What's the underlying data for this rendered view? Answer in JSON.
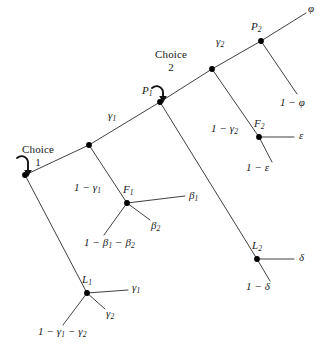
{
  "figure": {
    "type": "decision-tree-diagram",
    "title": "",
    "background_color": "#ffffff",
    "line_color": "#2a2a2a",
    "node_color": "#000000",
    "text_color": "#1a1a1a"
  },
  "annotations": {
    "choice1_word": "Choice",
    "choice1_number": "1",
    "choice2_word": "Choice",
    "choice2_number": "2"
  },
  "nodes": [
    {
      "id": "choice1",
      "label": "",
      "x": 25,
      "y": 175
    },
    {
      "id": "branch1",
      "label": "",
      "x": 89,
      "y": 145
    },
    {
      "id": "P1",
      "label": "P",
      "sub": "1",
      "x": 160,
      "y": 102
    },
    {
      "id": "branch2",
      "label": "",
      "x": 212,
      "y": 69
    },
    {
      "id": "P2",
      "label": "P",
      "sub": "2",
      "x": 261,
      "y": 41
    },
    {
      "id": "F1",
      "label": "F",
      "sub": "1",
      "x": 127,
      "y": 203
    },
    {
      "id": "F2",
      "label": "F",
      "sub": "2",
      "x": 259,
      "y": 137
    },
    {
      "id": "L1",
      "label": "L",
      "sub": "1",
      "x": 87,
      "y": 293
    },
    {
      "id": "L2",
      "label": "L",
      "sub": "2",
      "x": 257,
      "y": 259
    }
  ],
  "branch_labels": [
    {
      "id": "gamma1-spine",
      "text": "γ",
      "sub": "1",
      "x": 113,
      "y": 114
    },
    {
      "id": "gamma2-spine",
      "text": "γ",
      "sub": "2",
      "x": 220,
      "y": 40
    },
    {
      "id": "phi-top",
      "text": "φ",
      "sub": "",
      "x": 308,
      "y": 4
    },
    {
      "id": "one-minus-phi",
      "text": "1 − φ",
      "sub": "",
      "x": 282,
      "y": 100
    },
    {
      "id": "one-minus-gamma1",
      "text": "1 − γ",
      "sub": "1",
      "x": 78,
      "y": 185
    },
    {
      "id": "beta1",
      "text": "β",
      "sub": "1",
      "x": 190,
      "y": 196
    },
    {
      "id": "beta2",
      "text": "β",
      "sub": "2",
      "x": 152,
      "y": 224
    },
    {
      "id": "one-minus-beta1-beta2",
      "text": "1 − β",
      "sub": "1",
      "text2": " − β",
      "sub2": "2",
      "x": 84,
      "y": 240
    },
    {
      "id": "one-minus-gamma2",
      "text": "1 − γ",
      "sub": "2",
      "x": 212,
      "y": 126
    },
    {
      "id": "epsilon",
      "text": "ε",
      "sub": "",
      "x": 299,
      "y": 132
    },
    {
      "id": "one-minus-epsilon",
      "text": "1 − ε",
      "sub": "",
      "x": 248,
      "y": 164
    },
    {
      "id": "delta",
      "text": "δ",
      "sub": "",
      "x": 299,
      "y": 253
    },
    {
      "id": "one-minus-delta",
      "text": "1 − δ",
      "sub": "",
      "x": 248,
      "y": 283
    },
    {
      "id": "gamma1-L1",
      "text": "γ",
      "sub": "1",
      "x": 133,
      "y": 286
    },
    {
      "id": "gamma2-L1",
      "text": "γ",
      "sub": "2",
      "x": 106,
      "y": 312
    },
    {
      "id": "one-minus-gamma1-gamma2",
      "text": "1 − γ",
      "sub": "1",
      "text2": " − γ",
      "sub2": "2",
      "x": 38,
      "y": 329
    }
  ],
  "edges": [
    {
      "id": "choice1-to-branch1",
      "from": "choice1",
      "to": "branch1"
    },
    {
      "id": "branch1-to-P1",
      "from": "branch1",
      "to": "P1"
    },
    {
      "id": "P1-to-branch2",
      "from": "P1",
      "to": "branch2"
    },
    {
      "id": "branch2-to-P2",
      "from": "branch2",
      "to": "P2"
    },
    {
      "id": "P2-to-phi",
      "from": "P2",
      "to": "phi-end"
    },
    {
      "id": "P2-to-oneminusphi",
      "from": "P2",
      "to": "oneminusphi-end"
    },
    {
      "id": "branch1-to-F1",
      "from": "branch1",
      "to": "F1"
    },
    {
      "id": "branch2-to-F2",
      "from": "branch2",
      "to": "F2"
    },
    {
      "id": "choice1-to-L1",
      "from": "choice1",
      "to": "L1"
    },
    {
      "id": "P1-to-L2",
      "from": "P1",
      "to": "L2"
    },
    {
      "id": "F1-to-beta1",
      "from": "F1",
      "to": "beta1-end"
    },
    {
      "id": "F1-to-beta2",
      "from": "F1",
      "to": "beta2-end"
    },
    {
      "id": "F1-to-rest",
      "from": "F1",
      "to": "rest-beta-end"
    },
    {
      "id": "F2-to-epsilon",
      "from": "F2",
      "to": "epsilon-end"
    },
    {
      "id": "F2-to-oneminusepsilon",
      "from": "F2",
      "to": "oneminusepsilon-end"
    },
    {
      "id": "L1-to-gamma1",
      "from": "L1",
      "to": "gamma1-end"
    },
    {
      "id": "L1-to-gamma2",
      "from": "L1",
      "to": "gamma2-end"
    },
    {
      "id": "L1-to-rest",
      "from": "L1",
      "to": "rest-gamma-end"
    },
    {
      "id": "L2-to-delta",
      "from": "L2",
      "to": "delta-end"
    },
    {
      "id": "L2-to-oneminusdelta",
      "from": "L2",
      "to": "oneminusdelta-end"
    }
  ]
}
